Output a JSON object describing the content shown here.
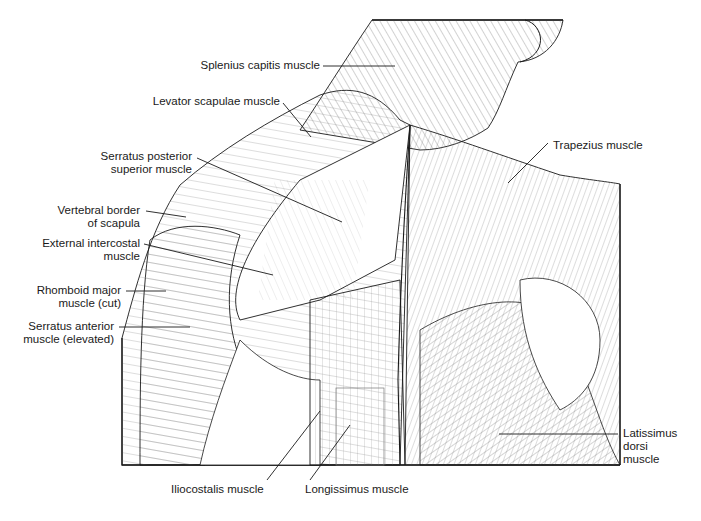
{
  "figure": {
    "type": "anatomical illustration"
  },
  "labels": {
    "splenius_capitis": "Splenius capitis muscle",
    "levator_scapulae": "Levator scapulae muscle",
    "serratus_posterior_superior": [
      "Serratus posterior",
      "superior muscle"
    ],
    "vertebral_border": [
      "Vertebral border",
      "of scapula"
    ],
    "external_intercostal": [
      "External intercostal",
      "muscle"
    ],
    "rhomboid_major": [
      "Rhomboid major",
      "muscle (cut)"
    ],
    "serratus_anterior": [
      "Serratus anterior",
      "muscle (elevated)"
    ],
    "trapezius": "Trapezius muscle",
    "latissimus_dorsi": [
      "Latissimus",
      "dorsi",
      "muscle"
    ],
    "iliocostalis": "Iliocostalis muscle",
    "longissimus": "Longissimus muscle"
  },
  "colors": {
    "line": "#1a1a1a",
    "hatch": "#555555",
    "background": "#ffffff"
  }
}
